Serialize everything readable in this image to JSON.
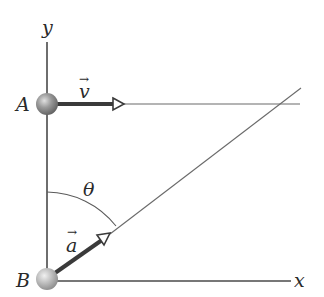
{
  "diagram": {
    "type": "physics-kinematics",
    "labels": {
      "y_axis": "y",
      "x_axis": "x",
      "point_a": "A",
      "point_b": "B",
      "velocity": "v",
      "acceleration": "a",
      "angle": "θ",
      "vector_arrow": "→"
    },
    "colors": {
      "axis": "#4a4a4a",
      "thin_line": "#6a6a6a",
      "arrow": "#3a3a3a",
      "ball": "#8c8c8c",
      "ball_highlight": "#d8d8d8",
      "text": "#2a2a2a"
    }
  }
}
